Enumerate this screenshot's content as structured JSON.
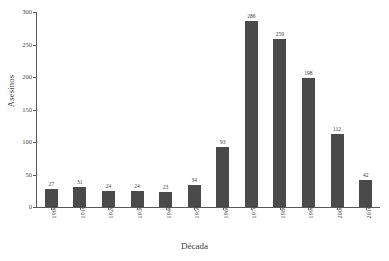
{
  "chart_data": {
    "type": "bar",
    "title": "",
    "xlabel": "Década",
    "ylabel": "Asesinos",
    "categories": [
      "1900",
      "1910",
      "1920",
      "1930",
      "1940",
      "1950",
      "1960",
      "1970",
      "1980",
      "1990",
      "2000",
      "2010"
    ],
    "values": [
      27,
      31,
      24,
      24,
      23,
      34,
      93,
      286,
      259,
      198,
      112,
      42
    ],
    "ylim": [
      0,
      300
    ],
    "yticks": [
      0,
      50,
      100,
      150,
      200,
      250,
      300
    ],
    "grid": false,
    "legend": null,
    "bar_color": "#4a4a4a",
    "axis_color": "#5a5a5a",
    "background": "#ffffff"
  }
}
